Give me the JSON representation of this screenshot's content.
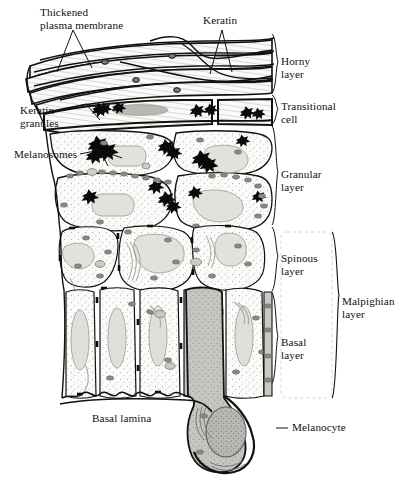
{
  "figure": {
    "kind": "histology-diagram",
    "background_color": "#ffffff",
    "ink_color": "#111111"
  },
  "labels": {
    "left": [
      {
        "id": "thickened-plasma-membrane",
        "text": "Thickened\nplasma membrane",
        "x": 40,
        "y": 6,
        "pointer": "triangle"
      },
      {
        "id": "keratin",
        "text": "Keratin",
        "x": 203,
        "y": 14,
        "pointer": "triangle"
      },
      {
        "id": "keratin-granules",
        "text": "Keratin\ngranules",
        "x": 20,
        "y": 104,
        "pointer": "fork"
      },
      {
        "id": "melanosomes",
        "text": "Melanosomes",
        "x": 14,
        "y": 148,
        "pointer": "fork"
      },
      {
        "id": "basal-lamina",
        "text": "Basal lamina",
        "x": 92,
        "y": 412,
        "pointer": "none"
      }
    ],
    "right": [
      {
        "id": "horny-layer",
        "text": "Horny\nlayer",
        "x": 281,
        "y": 55,
        "bracket_top": 34,
        "bracket_bottom": 93
      },
      {
        "id": "transitional-cell",
        "text": "Transitional\ncell",
        "x": 281,
        "y": 100,
        "bracket_top": 95,
        "bracket_bottom": 124
      },
      {
        "id": "granular-layer",
        "text": "Granular\nlayer",
        "x": 281,
        "y": 168,
        "bracket_top": 126,
        "bracket_bottom": 225
      },
      {
        "id": "spinous-layer",
        "text": "Spinous\nlayer",
        "x": 281,
        "y": 252,
        "bracket_top": 227,
        "bracket_bottom": 291
      },
      {
        "id": "basal-layer",
        "text": "Basal\nlayer",
        "x": 281,
        "y": 336,
        "bracket_top": 293,
        "bracket_bottom": 383
      },
      {
        "id": "malpighian-layer",
        "text": "Malpighian\nlayer",
        "x": 342,
        "y": 295,
        "bracket_top": 232,
        "bracket_bottom": 398
      },
      {
        "id": "melanocyte",
        "text": "Melanocyte",
        "x": 283,
        "y": 425,
        "pointer": "leader-line"
      }
    ]
  },
  "layer_bands": [
    {
      "name": "horny layer",
      "top": 34,
      "bottom": 93
    },
    {
      "name": "transitional cell",
      "top": 95,
      "bottom": 124
    },
    {
      "name": "granular layer",
      "top": 126,
      "bottom": 225
    },
    {
      "name": "spinous layer",
      "top": 227,
      "bottom": 291
    },
    {
      "name": "basal layer",
      "top": 293,
      "bottom": 383
    }
  ],
  "colors": {
    "ink": "#111111",
    "cell_fill": "#fbfbfa",
    "nucleus_fill": "#dcdcd6",
    "melanosome_fill": "#8d8d88",
    "melanocyte_fill": "#c3c3bd",
    "granule_black": "#0a0a0a",
    "stipple": "#9a9a94"
  }
}
